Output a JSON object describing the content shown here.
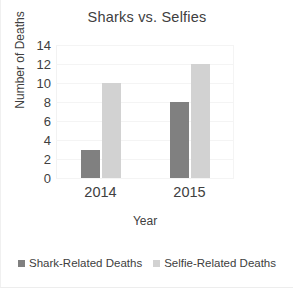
{
  "chart_data": {
    "type": "bar",
    "title": "Sharks vs. Selfies",
    "xlabel": "Year",
    "ylabel": "Number of Deaths",
    "categories": [
      "2014",
      "2015"
    ],
    "series": [
      {
        "name": "Shark-Related Deaths",
        "values": [
          3,
          8
        ],
        "color": "#808080"
      },
      {
        "name": "Selfie-Related Deaths",
        "values": [
          10,
          12
        ],
        "color": "#d2d2d2"
      }
    ],
    "ylim": [
      0,
      14
    ],
    "ytick_labels": [
      "14",
      "12",
      "10",
      "8",
      "6",
      "4",
      "2",
      "0"
    ],
    "ytick_values": [
      14,
      12,
      10,
      8,
      6,
      4,
      2,
      0
    ],
    "grid": true,
    "legend_position": "bottom"
  }
}
